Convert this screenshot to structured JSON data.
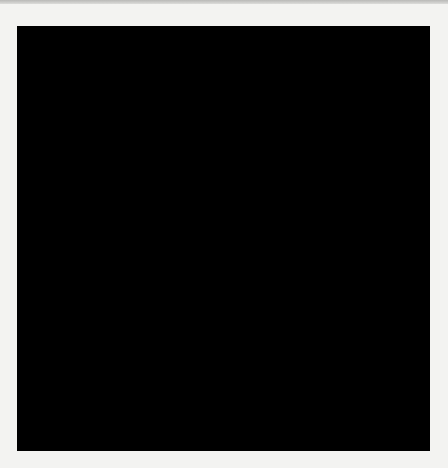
{
  "puzzle": {
    "rows": 19,
    "cols": 19,
    "grid": [
      "######.......#.....",
      "######..............",
      "x"
    ]
  }
}
